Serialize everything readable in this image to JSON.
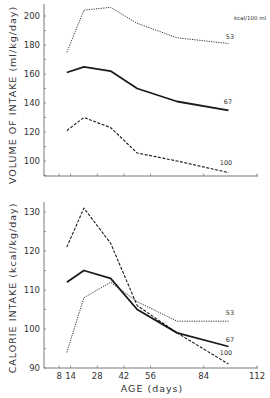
{
  "chart_data": [
    {
      "type": "line",
      "title": "",
      "xlabel": "AGE (days)",
      "ylabel": "VOLUME OF INTAKE (ml/kg/day)",
      "xlim": [
        0,
        112
      ],
      "ylim": [
        90,
        210
      ],
      "xticks": [
        8,
        14,
        28,
        42,
        56,
        84,
        112
      ],
      "yticks": [
        100,
        120,
        140,
        160,
        180,
        200
      ],
      "grid": false,
      "legend_title": "kcal/100 ml",
      "x": [
        12,
        21,
        35,
        49,
        70,
        97
      ],
      "series": [
        {
          "name": "53",
          "style": "dotted",
          "values": [
            175,
            204,
            206,
            195,
            185,
            181
          ]
        },
        {
          "name": "67",
          "style": "solid",
          "values": [
            161,
            165,
            162,
            150,
            141,
            135
          ]
        },
        {
          "name": "100",
          "style": "dashed",
          "values": [
            121,
            130,
            123,
            105.5,
            100,
            92
          ]
        }
      ]
    },
    {
      "type": "line",
      "title": "",
      "xlabel": "AGE (days)",
      "ylabel": "CALORIE INTAKE (kcal/kg/day)",
      "xlim": [
        0,
        112
      ],
      "ylim": [
        90,
        135
      ],
      "xticks": [
        8,
        14,
        28,
        42,
        56,
        84,
        112
      ],
      "yticks": [
        90,
        100,
        110,
        120,
        130
      ],
      "grid": false,
      "x": [
        12,
        21,
        35,
        49,
        70,
        97
      ],
      "series": [
        {
          "name": "53",
          "style": "dotted",
          "values": [
            94,
            108,
            112,
            107,
            102,
            102
          ]
        },
        {
          "name": "67",
          "style": "solid",
          "values": [
            112,
            115,
            113,
            105,
            99,
            95.5
          ]
        },
        {
          "name": "100",
          "style": "dashed",
          "values": [
            121,
            131,
            122,
            106,
            99,
            91
          ]
        }
      ]
    }
  ],
  "labels": {
    "top_ylabel": "VOLUME OF INTAKE  (ml/kg/day)",
    "bottom_ylabel": "CALORIE INTAKE  (kcal/kg/day)",
    "xlabel": "AGE  (days)",
    "legend_title": "kcal/100 ml"
  },
  "colors": {
    "line": "#1a1a1a",
    "axis": "#555555",
    "text": "#333333"
  }
}
